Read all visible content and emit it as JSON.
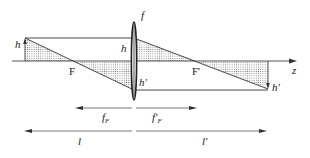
{
  "diagram": {
    "labels": {
      "lens": "f",
      "object_height": "h",
      "object_height_at_lens": "h",
      "image_height_at_lens": "h'",
      "image_height": "h'",
      "front_focus": "F",
      "back_focus": "F'",
      "axis": "z",
      "front_focal_length_main": "f",
      "front_focal_length_sub": "F",
      "back_focal_length_main": "f'",
      "back_focal_length_sub": "F",
      "object_distance": "l",
      "image_distance": "l'"
    },
    "colors": {
      "line": "#444444",
      "text": "#222222",
      "hatch": "#777777"
    }
  }
}
